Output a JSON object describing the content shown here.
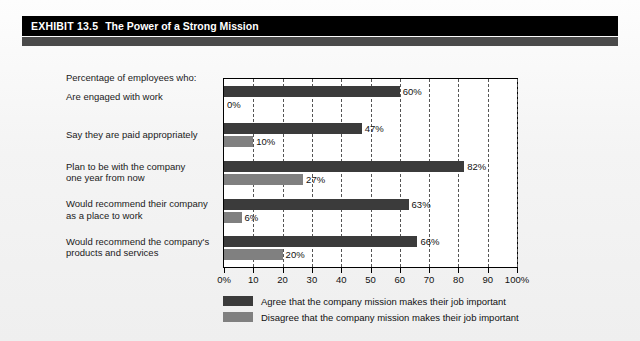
{
  "exhibit": {
    "number_label": "EXHIBIT 13.5",
    "title": "The Power of a Strong Mission"
  },
  "caption": "Percentage of employees who:",
  "colors": {
    "agree": "#3b3b3b",
    "disagree": "#808080",
    "title_bar": "#000000",
    "title_underbar": "#4a4a4a",
    "plot_border": "#000000",
    "gridline": "#555555",
    "page_background": "#f2f2f2"
  },
  "chart_data": {
    "type": "bar",
    "orientation": "horizontal",
    "title": "The Power of a Strong Mission",
    "xlabel": "",
    "ylabel": "",
    "xlim": [
      0,
      100
    ],
    "grid": true,
    "legend_position": "bottom",
    "categories": [
      "Are engaged with work",
      "Say they are paid appropriately",
      "Plan to be with the company\none year from now",
      "Would recommend their company\nas a place to work",
      "Would recommend the company's\nproducts and services"
    ],
    "category_lines": [
      [
        "Are engaged with work"
      ],
      [
        "Say they are paid appropriately"
      ],
      [
        "Plan to be with the company",
        "one year from now"
      ],
      [
        "Would recommend their company",
        "as a place to work"
      ],
      [
        "Would recommend the company's",
        "products and services"
      ]
    ],
    "series": [
      {
        "name": "Agree that the company mission makes their job important",
        "color": "#3b3b3b",
        "values": [
          60,
          47,
          82,
          63,
          66
        ],
        "labels": [
          "60%",
          "47%",
          "82%",
          "63%",
          "66%"
        ]
      },
      {
        "name": "Disagree that the company mission makes their job important",
        "color": "#808080",
        "values": [
          0,
          10,
          27,
          6,
          20
        ],
        "labels": [
          "0%",
          "10%",
          "27%",
          "6%",
          "20%"
        ]
      }
    ],
    "xticks": [
      0,
      10,
      20,
      30,
      40,
      50,
      60,
      70,
      80,
      90,
      100
    ],
    "xticklabels": [
      "0%",
      "10",
      "20",
      "30",
      "40",
      "50",
      "60",
      "70",
      "80",
      "90",
      "100%"
    ]
  },
  "legend": [
    {
      "swatch_color": "#3b3b3b",
      "label": "Agree that the company mission makes their job important"
    },
    {
      "swatch_color": "#808080",
      "label": "Disagree that the company mission makes their job important"
    }
  ]
}
